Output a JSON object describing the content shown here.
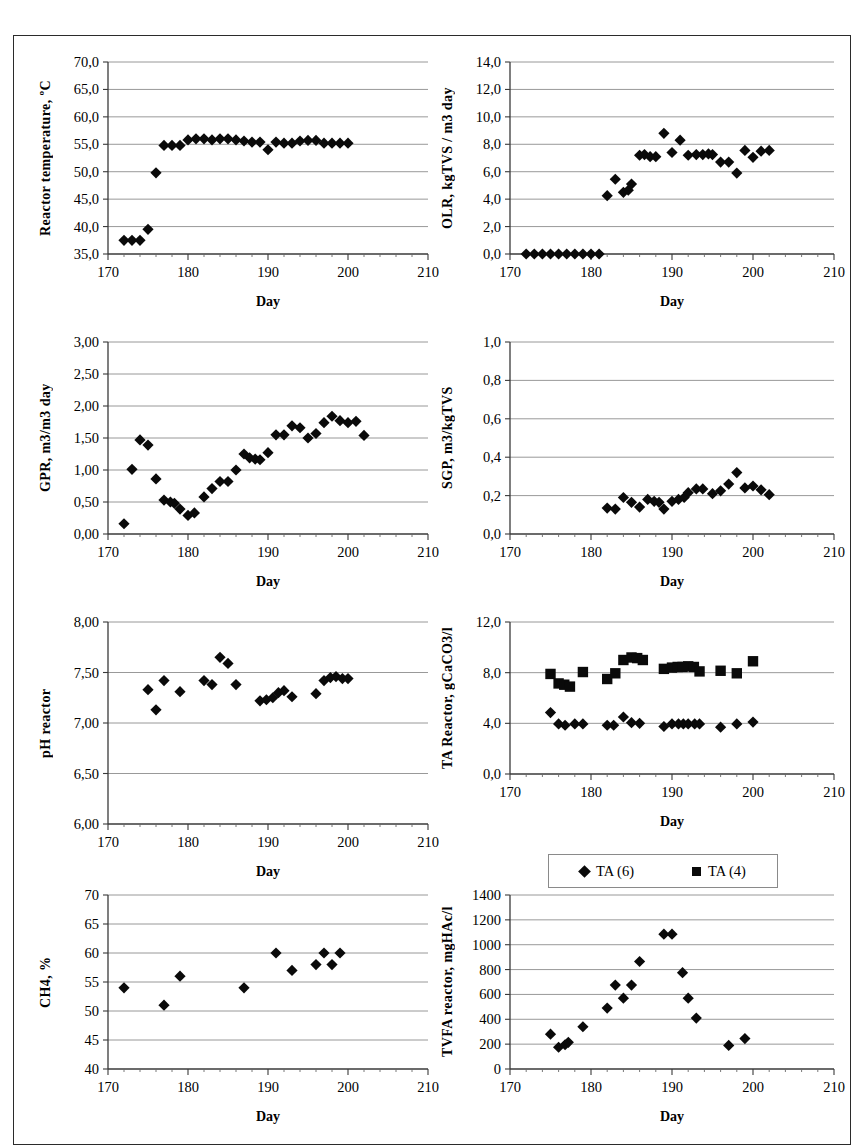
{
  "figure": {
    "panel_count": 8,
    "marker_color": "#0a0a0a",
    "gridline_color": "#8d8d8d",
    "axis_color": "#3a3a3a"
  },
  "legend": {
    "entries": [
      {
        "label": "TA (6)",
        "marker": "diamond"
      },
      {
        "label": "TA (4)",
        "marker": "square"
      }
    ]
  },
  "chart_data": [
    {
      "id": "reactor-temperature",
      "type": "scatter",
      "title": "",
      "ylabel": "Reactor temperature, ºC",
      "xlabel": "Day",
      "xlim": [
        170,
        210
      ],
      "ylim": [
        35.0,
        70.0
      ],
      "xticks": [
        170,
        180,
        190,
        200,
        210
      ],
      "yticks": [
        35.0,
        40.0,
        45.0,
        50.0,
        55.0,
        60.0,
        65.0,
        70.0
      ],
      "ytick_labels": [
        "35,0",
        "40,0",
        "45,0",
        "50,0",
        "55,0",
        "60,0",
        "65,0",
        "70,0"
      ],
      "xtick_labels": [
        "170",
        "180",
        "190",
        "200",
        "210"
      ],
      "grid": true,
      "series": [
        {
          "name": "Reactor temperature",
          "marker": "diamond",
          "x": [
            172,
            173,
            174,
            175,
            176,
            177,
            178,
            179,
            180,
            181,
            182,
            183,
            184,
            185,
            186,
            187,
            188,
            189,
            190,
            191,
            192,
            193,
            194,
            195,
            196,
            197,
            198,
            199,
            200
          ],
          "y": [
            37.5,
            37.5,
            37.5,
            39.5,
            49.8,
            54.8,
            54.8,
            54.8,
            55.8,
            56.0,
            56.0,
            55.8,
            56.0,
            56.0,
            55.8,
            55.6,
            55.4,
            55.4,
            54.0,
            55.4,
            55.2,
            55.2,
            55.6,
            55.7,
            55.7,
            55.2,
            55.2,
            55.2,
            55.2
          ]
        }
      ]
    },
    {
      "id": "olr",
      "type": "scatter",
      "title": "",
      "ylabel": "OLR, kgTVS / m3 day",
      "xlabel": "Day",
      "xlim": [
        170,
        210
      ],
      "ylim": [
        0.0,
        14.0
      ],
      "xticks": [
        170,
        180,
        190,
        200,
        210
      ],
      "yticks": [
        0.0,
        2.0,
        4.0,
        6.0,
        8.0,
        10.0,
        12.0,
        14.0
      ],
      "ytick_labels": [
        "0,0",
        "2,0",
        "4,0",
        "6,0",
        "8,0",
        "10,0",
        "12,0",
        "14,0"
      ],
      "xtick_labels": [
        "170",
        "180",
        "190",
        "200",
        "210"
      ],
      "grid": true,
      "series": [
        {
          "name": "OLR",
          "marker": "diamond",
          "x": [
            172,
            173,
            174,
            175,
            176,
            177,
            178,
            179,
            180,
            181,
            182,
            183,
            184,
            184.6,
            185,
            186,
            186.6,
            187.3,
            188,
            189,
            190,
            191,
            192,
            193,
            193.8,
            194.5,
            195,
            196,
            197,
            198,
            199,
            200,
            201,
            202
          ],
          "y": [
            0.0,
            0.0,
            0.0,
            0.0,
            0.0,
            0.0,
            0.0,
            0.0,
            0.0,
            0.0,
            4.25,
            5.45,
            4.5,
            4.65,
            5.1,
            7.2,
            7.25,
            7.1,
            7.1,
            8.8,
            7.4,
            8.3,
            7.2,
            7.25,
            7.25,
            7.3,
            7.25,
            6.7,
            6.7,
            5.9,
            7.55,
            7.05,
            7.5,
            7.55
          ]
        }
      ]
    },
    {
      "id": "gpr",
      "type": "scatter",
      "title": "",
      "ylabel": "GPR, m3/m3 day",
      "xlabel": "Day",
      "xlim": [
        170,
        210
      ],
      "ylim": [
        0.0,
        3.0
      ],
      "xticks": [
        170,
        180,
        190,
        200,
        210
      ],
      "yticks": [
        0.0,
        0.5,
        1.0,
        1.5,
        2.0,
        2.5,
        3.0
      ],
      "ytick_labels": [
        "0,00",
        "0,50",
        "1,00",
        "1,50",
        "2,00",
        "2,50",
        "3,00"
      ],
      "xtick_labels": [
        "170",
        "180",
        "190",
        "200",
        "210"
      ],
      "grid": true,
      "series": [
        {
          "name": "GPR",
          "marker": "diamond",
          "x": [
            172,
            173,
            174,
            175,
            176,
            177,
            177.8,
            178.3,
            179,
            180,
            180.8,
            182,
            183,
            184,
            185,
            186,
            187,
            187.7,
            188.4,
            189,
            190,
            191,
            192,
            193,
            194,
            195,
            196,
            197,
            198,
            199,
            200,
            201,
            202
          ],
          "y": [
            0.16,
            1.01,
            1.47,
            1.39,
            0.86,
            0.53,
            0.5,
            0.48,
            0.39,
            0.29,
            0.33,
            0.58,
            0.71,
            0.82,
            0.82,
            1.0,
            1.25,
            1.19,
            1.17,
            1.16,
            1.27,
            1.55,
            1.55,
            1.69,
            1.66,
            1.5,
            1.57,
            1.74,
            1.84,
            1.77,
            1.74,
            1.76,
            1.54
          ]
        }
      ]
    },
    {
      "id": "sgp",
      "type": "scatter",
      "title": "",
      "ylabel": "SGP, m3/kgTVS",
      "xlabel": "Day",
      "xlim": [
        170,
        210
      ],
      "ylim": [
        0.0,
        1.0
      ],
      "xticks": [
        170,
        180,
        190,
        200,
        210
      ],
      "yticks": [
        0.0,
        0.2,
        0.4,
        0.6,
        0.8,
        1.0
      ],
      "ytick_labels": [
        "0,0",
        "0,2",
        "0,4",
        "0,6",
        "0,8",
        "1,0"
      ],
      "xtick_labels": [
        "170",
        "180",
        "190",
        "200",
        "210"
      ],
      "grid": true,
      "series": [
        {
          "name": "SGP",
          "marker": "diamond",
          "x": [
            182,
            183,
            184,
            185,
            186,
            187,
            187.8,
            188.4,
            189,
            190,
            190.8,
            191.5,
            192,
            193,
            193.8,
            195,
            196,
            197,
            198,
            199,
            200,
            201,
            202
          ],
          "y": [
            0.135,
            0.13,
            0.19,
            0.165,
            0.14,
            0.18,
            0.17,
            0.165,
            0.13,
            0.17,
            0.18,
            0.19,
            0.215,
            0.235,
            0.235,
            0.21,
            0.225,
            0.26,
            0.32,
            0.24,
            0.25,
            0.23,
            0.205
          ]
        }
      ]
    },
    {
      "id": "ph-reactor",
      "type": "scatter",
      "title": "",
      "ylabel": "pH reactor",
      "xlabel": "Day",
      "xlim": [
        170,
        210
      ],
      "ylim": [
        6.0,
        8.0
      ],
      "xticks": [
        170,
        180,
        190,
        200,
        210
      ],
      "yticks": [
        6.0,
        6.5,
        7.0,
        7.5,
        8.0
      ],
      "ytick_labels": [
        "6,00",
        "6,50",
        "7,00",
        "7,50",
        "8,00"
      ],
      "xtick_labels": [
        "170",
        "180",
        "190",
        "200",
        "210"
      ],
      "grid": true,
      "series": [
        {
          "name": "pH reactor",
          "marker": "diamond",
          "x": [
            175,
            176,
            177,
            179,
            182,
            183,
            184,
            185,
            186,
            189,
            189.8,
            190.6,
            191.3,
            192,
            193,
            196,
            197,
            197.8,
            198.5,
            199.3,
            200
          ],
          "y": [
            7.33,
            7.13,
            7.42,
            7.31,
            7.42,
            7.38,
            7.65,
            7.59,
            7.38,
            7.22,
            7.23,
            7.25,
            7.3,
            7.32,
            7.26,
            7.29,
            7.42,
            7.45,
            7.46,
            7.44,
            7.44
          ]
        }
      ]
    },
    {
      "id": "ta-reactor",
      "type": "scatter",
      "title": "",
      "ylabel": "TA Reactor, gCaCO3/l",
      "xlabel": "Day",
      "xlim": [
        170,
        210
      ],
      "ylim": [
        0.0,
        12.0
      ],
      "xticks": [
        170,
        180,
        190,
        200,
        210
      ],
      "yticks": [
        0.0,
        4.0,
        8.0,
        12.0
      ],
      "ytick_labels": [
        "0,0",
        "4,0",
        "8,0",
        "12,0"
      ],
      "xtick_labels": [
        "170",
        "180",
        "190",
        "200",
        "210"
      ],
      "grid": true,
      "series": [
        {
          "name": "TA (6)",
          "marker": "diamond",
          "x": [
            175,
            176,
            176.8,
            178,
            179,
            182,
            182.8,
            184,
            185,
            186,
            189,
            190,
            190.8,
            191.4,
            192,
            192.8,
            193.4,
            196,
            198,
            200
          ],
          "y": [
            4.85,
            3.95,
            3.85,
            3.95,
            3.95,
            3.85,
            3.85,
            4.5,
            4.05,
            4.0,
            3.75,
            3.95,
            3.95,
            3.95,
            3.95,
            3.95,
            3.95,
            3.7,
            3.95,
            4.1
          ]
        },
        {
          "name": "TA (4)",
          "marker": "square",
          "x": [
            175,
            176,
            176.7,
            177.4,
            179,
            182,
            183,
            184,
            185,
            185.7,
            186.4,
            189,
            190,
            190.7,
            191.3,
            192,
            192.7,
            193.4,
            196,
            198,
            200
          ],
          "y": [
            7.9,
            7.15,
            7.05,
            6.9,
            8.05,
            7.5,
            7.95,
            9.0,
            9.2,
            9.15,
            9.0,
            8.3,
            8.4,
            8.45,
            8.45,
            8.5,
            8.45,
            8.1,
            8.15,
            7.95,
            8.9
          ]
        }
      ]
    },
    {
      "id": "ch4",
      "type": "scatter",
      "title": "",
      "ylabel": "CH4, %",
      "xlabel": "Day",
      "xlim": [
        170,
        210
      ],
      "ylim": [
        40,
        70
      ],
      "xticks": [
        170,
        180,
        190,
        200,
        210
      ],
      "yticks": [
        40,
        45,
        50,
        55,
        60,
        65,
        70
      ],
      "ytick_labels": [
        "40",
        "45",
        "50",
        "55",
        "60",
        "65",
        "70"
      ],
      "xtick_labels": [
        "170",
        "180",
        "190",
        "200",
        "210"
      ],
      "grid": true,
      "series": [
        {
          "name": "CH4",
          "marker": "diamond",
          "x": [
            172,
            177,
            179,
            187,
            191,
            193,
            196,
            197,
            198,
            199
          ],
          "y": [
            54,
            51,
            56,
            54,
            60,
            57,
            58,
            60,
            58,
            60
          ]
        }
      ]
    },
    {
      "id": "tvfa-reactor",
      "type": "scatter",
      "title": "",
      "ylabel": "TVFA reactor, mgHAc/l",
      "xlabel": "Day",
      "xlim": [
        170,
        210
      ],
      "ylim": [
        0,
        1400
      ],
      "xticks": [
        170,
        180,
        190,
        200,
        210
      ],
      "yticks": [
        0,
        200,
        400,
        600,
        800,
        1000,
        1200,
        1400
      ],
      "ytick_labels": [
        "0",
        "200",
        "400",
        "600",
        "800",
        "1000",
        "1200",
        "1400"
      ],
      "xtick_labels": [
        "170",
        "180",
        "190",
        "200",
        "210"
      ],
      "grid": true,
      "series": [
        {
          "name": "TVFA reactor",
          "marker": "diamond",
          "x": [
            175,
            176,
            176.8,
            177.2,
            179,
            182,
            183,
            184,
            185,
            186,
            189,
            190,
            191.3,
            192,
            193,
            197,
            199
          ],
          "y": [
            280,
            175,
            195,
            215,
            340,
            490,
            675,
            570,
            675,
            865,
            1085,
            1085,
            775,
            570,
            410,
            190,
            245
          ]
        }
      ]
    }
  ]
}
